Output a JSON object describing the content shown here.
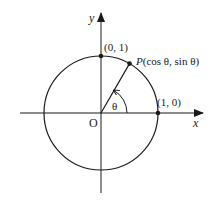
{
  "diagram": {
    "type": "unit-circle",
    "colors": {
      "stroke": "#1a1a1a",
      "background": "#ffffff"
    },
    "axes": {
      "x_label": "x",
      "y_label": "y",
      "origin_label": "O"
    },
    "points": [
      {
        "id": "top",
        "label": "(0, 1)"
      },
      {
        "id": "right",
        "label": "(1, 0)"
      },
      {
        "id": "p",
        "label_prefix": "P",
        "label_rest": "(cos θ, sin θ)"
      }
    ],
    "angle": {
      "label": "θ",
      "degrees_approx": 60
    }
  }
}
